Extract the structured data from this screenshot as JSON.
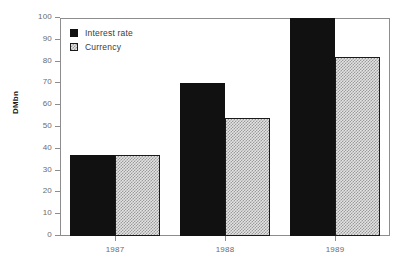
{
  "chart_data": {
    "type": "bar",
    "title": "",
    "subtitle": "",
    "xlabel": "",
    "ylabel": "DMbn",
    "categories": [
      "1987",
      "1988",
      "1989"
    ],
    "series": [
      {
        "name": "Interest rate",
        "values": [
          37,
          70,
          100
        ],
        "color": "#111111",
        "fill": "solid-black"
      },
      {
        "name": "Currency",
        "values": [
          37,
          54,
          82
        ],
        "color": "#e3e3e3",
        "fill": "checkered-gray"
      }
    ],
    "ylim": [
      0,
      100
    ],
    "yticks": [
      0,
      10,
      20,
      30,
      40,
      50,
      60,
      70,
      80,
      90,
      100
    ],
    "ytick_labels": [
      "0",
      "10",
      "20",
      "30",
      "40",
      "50",
      "60",
      "70",
      "80",
      "90",
      "100"
    ],
    "grid": false,
    "legend_position": "top-left-inside",
    "frame": true,
    "orientation": "vertical",
    "grouping": "grouped-adjacent"
  },
  "legend": {
    "entries": [
      {
        "label": "Interest rate",
        "swatch": "solid-black-swatch"
      },
      {
        "label": "Currency",
        "swatch": "checkered-gray-swatch"
      }
    ]
  },
  "axes": {
    "y_title": "DMbn",
    "y_labels": [
      "100",
      "90",
      "80",
      "70",
      "60",
      "50",
      "40",
      "30",
      "20",
      "10",
      "0"
    ],
    "x_labels": [
      "1987",
      "1988",
      "1989"
    ]
  },
  "colors": {
    "frame": "#8d8d8d",
    "tick_text": "#6b6b6b",
    "series_dark": "#111111",
    "series_hatch": "#e3e3e3",
    "background": "#ffffff"
  }
}
